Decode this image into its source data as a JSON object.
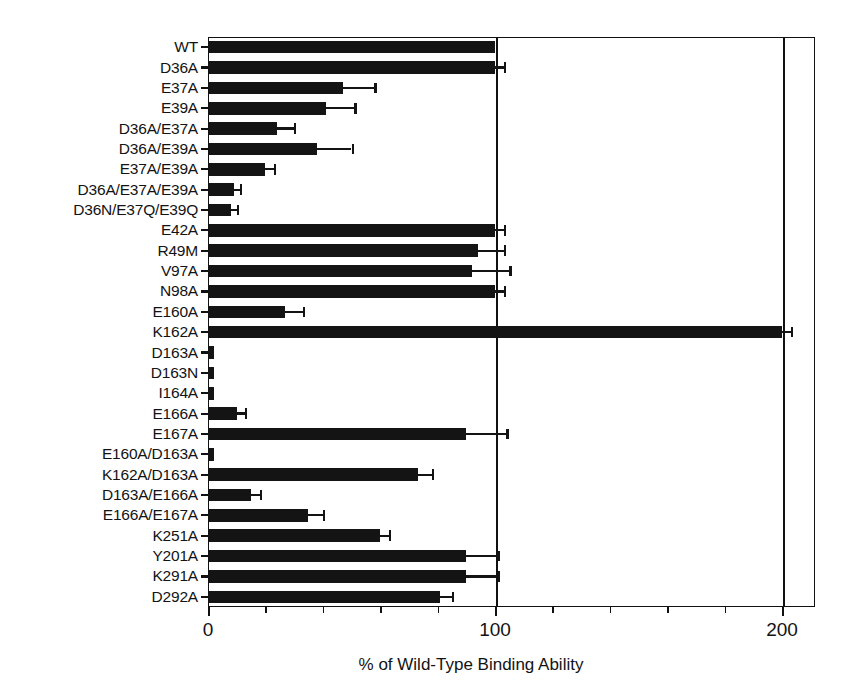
{
  "chart_data": {
    "type": "bar",
    "orientation": "horizontal",
    "title": "",
    "xlabel": "% of Wild-Type Binding Ability",
    "ylabel": "",
    "xlim": [
      0,
      212
    ],
    "grid": false,
    "legend": null,
    "bar_color": "#141414",
    "axis_color": "#111111",
    "background": "#ffffff",
    "xticks": [
      0,
      100,
      200
    ],
    "xticklabels": [
      "0",
      "100",
      "200"
    ],
    "xminorticks": [
      20,
      40,
      60,
      80,
      120,
      140,
      160,
      180
    ],
    "reference_lines": [
      100,
      200
    ],
    "categories": [
      "WT",
      "D36A",
      "E37A",
      "E39A",
      "D36A/E37A",
      "D36A/E39A",
      "E37A/E39A",
      "D36A/E37A/E39A",
      "D36N/E37Q/E39Q",
      "E42A",
      "R49M",
      "V97A",
      "N98A",
      "E160A",
      "K162A",
      "D163A",
      "D163N",
      "I164A",
      "E166A",
      "E167A",
      "E160A/D163A",
      "K162A/D163A",
      "D163A/E166A",
      "E166A/E167A",
      "K251A",
      "Y201A",
      "K291A",
      "D292A"
    ],
    "values": [
      100,
      100,
      47,
      41,
      24,
      38,
      20,
      9,
      8,
      100,
      94,
      92,
      100,
      27,
      200,
      2,
      2,
      2,
      10,
      90,
      2,
      73,
      15,
      35,
      60,
      90,
      90,
      81
    ],
    "errors": [
      0,
      3,
      11,
      10,
      6,
      12,
      3,
      2,
      2,
      3,
      9,
      13,
      3,
      6,
      3,
      0,
      0,
      0,
      3,
      14,
      0,
      5,
      3,
      5,
      3,
      11,
      11,
      4
    ]
  },
  "axis": {
    "xlabel": "% of Wild-Type Binding Ability"
  }
}
